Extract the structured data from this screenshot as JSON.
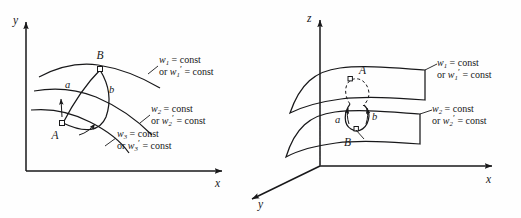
{
  "figure": {
    "background_color": "#fefefe",
    "ink_color": "#18181a",
    "width": 521,
    "height": 218
  },
  "left_panel": {
    "name": "two-dimensional level-curve diagram",
    "axes": {
      "vertical_label": "y",
      "horizontal_label": "x"
    },
    "points": [
      {
        "id": "A",
        "label": "A"
      },
      {
        "id": "B",
        "label": "B"
      }
    ],
    "paths": [
      {
        "id": "a",
        "label": "a"
      },
      {
        "id": "b",
        "label": "b"
      }
    ],
    "curve_labels": [
      {
        "id": "w1",
        "line1_var": "w",
        "line1_sub": "1",
        "line1_rest": " = const",
        "line2_prefix": "or ",
        "line2_var": "w",
        "line2_sub": "1",
        "line2_prime": "′",
        "line2_rest": " = const"
      },
      {
        "id": "w2",
        "line1_var": "w",
        "line1_sub": "2",
        "line1_rest": " = const",
        "line2_prefix": "or ",
        "line2_var": "w",
        "line2_sub": "2",
        "line2_prime": "′",
        "line2_rest": " = const"
      },
      {
        "id": "w3",
        "line1_var": "w",
        "line1_sub": "3",
        "line1_rest": " = const",
        "line2_prefix": "or ",
        "line2_var": "w",
        "line2_sub": "3",
        "line2_prime": "′",
        "line2_rest": " = const"
      }
    ]
  },
  "right_panel": {
    "name": "three-dimensional level-surface diagram",
    "axes": {
      "vertical_label": "z",
      "horizontal_label": "x",
      "depth_label": "y"
    },
    "points": [
      {
        "id": "A",
        "label": "A"
      },
      {
        "id": "B",
        "label": "B"
      }
    ],
    "paths": [
      {
        "id": "a",
        "label": "a"
      },
      {
        "id": "b",
        "label": "b"
      }
    ],
    "surface_labels": [
      {
        "id": "w1",
        "line1_var": "w",
        "line1_sub": "1",
        "line1_rest": " = const",
        "line2_prefix": "or ",
        "line2_var": "w",
        "line2_sub": "1",
        "line2_prime": "′",
        "line2_rest": " = const"
      },
      {
        "id": "w2",
        "line1_var": "w",
        "line1_sub": "2",
        "line1_rest": " = const",
        "line2_prefix": "or ",
        "line2_var": "w",
        "line2_sub": "2",
        "line2_prime": "′",
        "line2_rest": " = const"
      }
    ]
  }
}
